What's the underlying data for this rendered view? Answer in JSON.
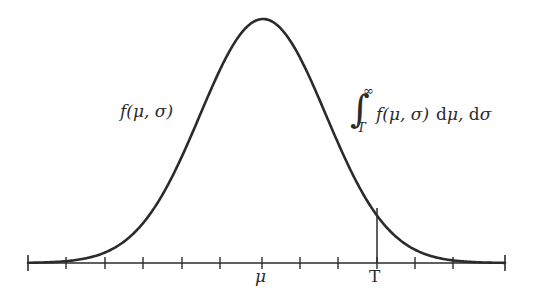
{
  "figure": {
    "type": "normal-distribution-tail-diagram",
    "background_color": "#ffffff",
    "stroke_color": "#2b2b2b"
  },
  "labels": {
    "density": "f(μ, σ)",
    "integral": {
      "sign": "∫",
      "upper_limit": "∞",
      "lower_limit": "T",
      "integrand": "f(μ, σ)",
      "differential_d1": "d",
      "differential_var1": "μ,",
      "differential_d2": "d",
      "differential_var2": "σ",
      "full_text": "∫_T^∞ f(μ, σ) dμ, dσ"
    },
    "axis_ticks": {
      "mu": "μ",
      "threshold": "T"
    }
  },
  "chart_data": {
    "type": "line",
    "title": "",
    "xlabel": "",
    "ylabel": "",
    "grid": false,
    "legend": false,
    "axis": {
      "x_start_px": 28,
      "x_end_px": 505,
      "baseline_y_px": 263,
      "tick_length_px": 9,
      "tick_positions_px": [
        28,
        66,
        105,
        143,
        182,
        220,
        262,
        300,
        338,
        377,
        415,
        453,
        505
      ],
      "labeled_ticks": [
        {
          "label": "μ",
          "x_px": 262
        },
        {
          "label": "T",
          "x_px": 377
        }
      ]
    },
    "curve": {
      "name": "Gaussian density f(μ, σ)",
      "peak_x_px": 263,
      "peak_y_px": 19,
      "mean_px": 263,
      "sigma_px": 63,
      "amplitude_px": 244,
      "stroke_width_px": 2.6
    },
    "threshold_marker": {
      "label": "T",
      "x_px": 377,
      "y_top_px": 208,
      "y_bottom_px": 263,
      "shaded_region": "tail from T to infinity"
    },
    "x": [
      28,
      50,
      75,
      100,
      125,
      150,
      175,
      200,
      225,
      250,
      263,
      275,
      300,
      325,
      350,
      377,
      400,
      425,
      450,
      475,
      505
    ],
    "y": [
      262.9,
      262.5,
      260.3,
      253.7,
      238.4,
      211.0,
      171.5,
      126.3,
      70.0,
      30.3,
      19.0,
      24.8,
      59.8,
      112.4,
      163.6,
      208.0,
      232.1,
      248.6,
      257.4,
      261.3,
      262.8
    ]
  }
}
